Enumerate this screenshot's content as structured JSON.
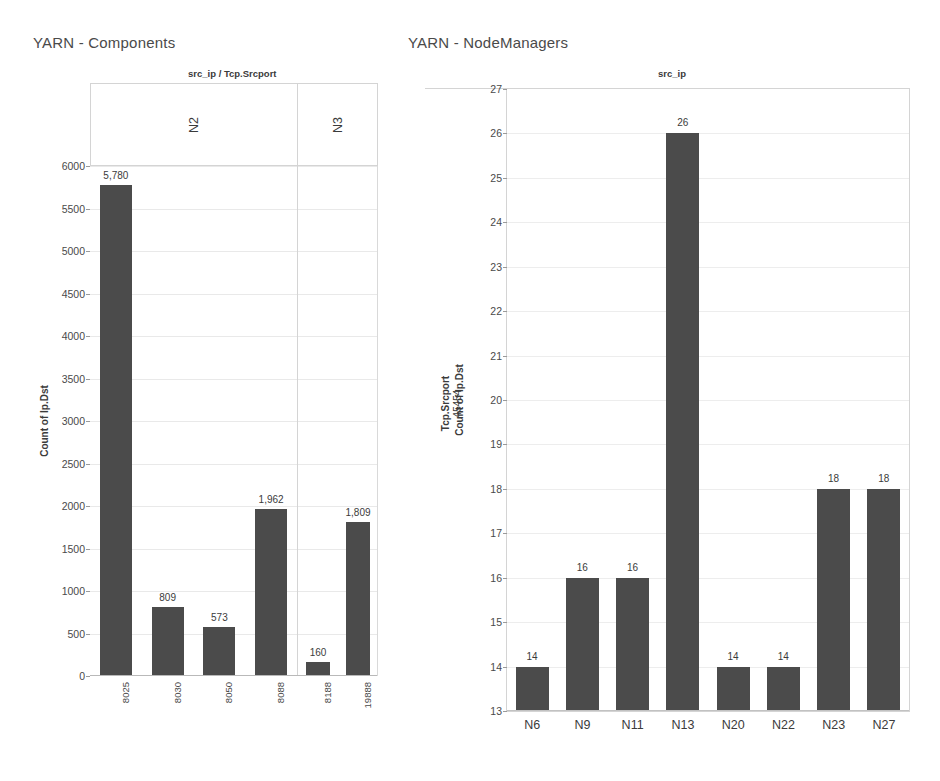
{
  "charts": [
    {
      "id": "yarn-components",
      "title": "YARN - Components",
      "chart_data": {
        "type": "bar",
        "title": "YARN - Components",
        "column_header_title": "src_ip / Tcp.Srcport",
        "ylabel": "Count of Ip.Dst",
        "xlabel": "",
        "ylim": [
          0,
          6000
        ],
        "yticks": [
          0,
          500,
          1000,
          1500,
          2000,
          2500,
          3000,
          3500,
          4000,
          4500,
          5000,
          5500,
          6000
        ],
        "ytick_labels": [
          "0",
          "500",
          "1000",
          "1500",
          "2000",
          "2500",
          "3000",
          "3500",
          "4000",
          "4500",
          "5000",
          "5500",
          "6000"
        ],
        "grid": true,
        "legend": "none",
        "panels": [
          {
            "label": "N2",
            "categories": [
              "8025",
              "8030",
              "8050",
              "8088"
            ],
            "values": [
              5780,
              809,
              573,
              1962
            ],
            "value_labels": [
              "5,780",
              "809",
              "573",
              "1,962"
            ]
          },
          {
            "label": "N3",
            "categories": [
              "8188",
              "19888"
            ],
            "values": [
              160,
              1809
            ],
            "value_labels": [
              "160",
              "1,809"
            ]
          }
        ],
        "bar_color": "#4b4b4b"
      }
    },
    {
      "id": "yarn-nodemanagers",
      "title": "YARN - NodeManagers",
      "chart_data": {
        "type": "bar",
        "title": "YARN - NodeManagers",
        "column_header_title": "src_ip",
        "row_header_title": "Tcp.Srcport",
        "row_header_value": "45454",
        "ylabel": "Count of Ip.Dst",
        "xlabel": "",
        "ylim": [
          13,
          27
        ],
        "yticks": [
          13,
          14,
          15,
          16,
          17,
          18,
          19,
          20,
          21,
          22,
          23,
          24,
          25,
          26,
          27
        ],
        "ytick_labels": [
          "13",
          "14",
          "15",
          "16",
          "17",
          "18",
          "19",
          "20",
          "21",
          "22",
          "23",
          "24",
          "25",
          "26",
          "27"
        ],
        "grid": true,
        "legend": "none",
        "categories": [
          "N6",
          "N9",
          "N11",
          "N13",
          "N20",
          "N22",
          "N23",
          "N27"
        ],
        "values": [
          14,
          16,
          16,
          26,
          14,
          14,
          18,
          18
        ],
        "value_labels": [
          "14",
          "16",
          "16",
          "26",
          "14",
          "14",
          "18",
          "18"
        ],
        "bar_color": "#4b4b4b"
      }
    }
  ],
  "colors": {
    "bar": "#4b4b4b",
    "grid": "#ededed",
    "frame": "#d4d4d4",
    "text": "#3b3b3b",
    "background": "#ffffff"
  }
}
